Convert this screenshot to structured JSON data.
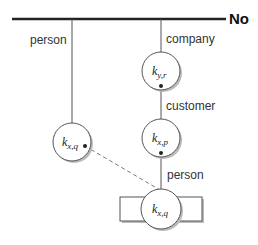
{
  "diagram": {
    "root_label": "No",
    "edges": {
      "left_label": "person",
      "company_label": "company",
      "customer_label": "customer",
      "person_label": "person"
    },
    "nodes": {
      "top": {
        "main": "k",
        "sub": "y,r"
      },
      "middle": {
        "main": "k",
        "sub": "x,p"
      },
      "left": {
        "main": "k",
        "sub": "x,q"
      },
      "bottom": {
        "main": "k",
        "sub": "x,q"
      }
    },
    "colors": {
      "line": "#555555",
      "root_line": "#222222",
      "circle_fill": "#ffffff",
      "shadow": "#bbbbbb"
    }
  }
}
